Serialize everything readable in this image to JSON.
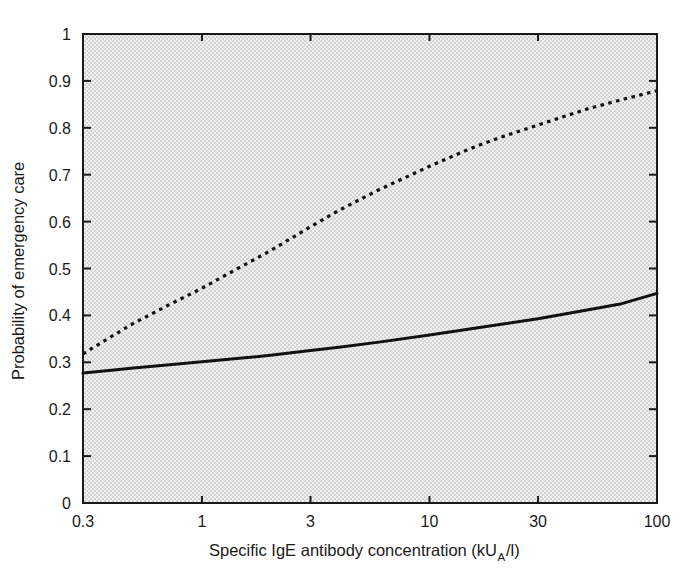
{
  "chart_data": {
    "type": "line",
    "title": "",
    "xlabel": "Specific IgE antibody concentration (kU_A/l)",
    "xlabel_main": "Specific IgE antibody concentration (kU",
    "xlabel_sub": "A",
    "xlabel_tail": "/l)",
    "ylabel": "Probability of emergency care",
    "xscale": "log",
    "yscale": "linear",
    "xlim": [
      0.3,
      100
    ],
    "ylim": [
      0,
      1
    ],
    "grid": false,
    "legend": "none",
    "background_color": "#e3e3e3",
    "axis_color": "#1a1a1a",
    "xticks": [
      0.3,
      1,
      3,
      10,
      30,
      100
    ],
    "xtick_labels": [
      "0.3",
      "1",
      "3",
      "10",
      "30",
      "100"
    ],
    "yticks": [
      0,
      0.1,
      0.2,
      0.3,
      0.4,
      0.5,
      0.6,
      0.7,
      0.8,
      0.9,
      1
    ],
    "ytick_labels": [
      "0",
      "0.1",
      "0.2",
      "0.3",
      "0.4",
      "0.5",
      "0.6",
      "0.7",
      "0.8",
      "0.9",
      "1"
    ],
    "x": [
      0.3,
      0.4,
      0.5,
      0.7,
      1.0,
      1.5,
      2.0,
      3.0,
      4.0,
      6.0,
      10.0,
      15.0,
      20.0,
      30.0,
      50.0,
      70.0,
      100.0
    ],
    "series": [
      {
        "name": "solid-curve",
        "style": "solid",
        "color": "#111111",
        "values": [
          0.277,
          0.283,
          0.288,
          0.294,
          0.301,
          0.309,
          0.315,
          0.325,
          0.332,
          0.343,
          0.358,
          0.371,
          0.38,
          0.393,
          0.412,
          0.425,
          0.447
        ]
      },
      {
        "name": "dashed-curve",
        "style": "dashed",
        "color": "#111111",
        "values": [
          0.318,
          0.355,
          0.383,
          0.42,
          0.458,
          0.505,
          0.538,
          0.589,
          0.624,
          0.668,
          0.718,
          0.755,
          0.778,
          0.806,
          0.841,
          0.86,
          0.879
        ]
      }
    ]
  },
  "figure": {
    "plot_left_px": 83,
    "plot_top_px": 34,
    "plot_right_px": 657,
    "plot_bottom_px": 503
  }
}
